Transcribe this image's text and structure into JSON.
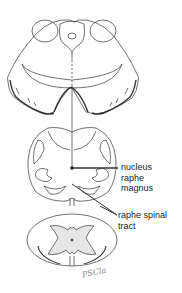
{
  "figure": {
    "sections": [
      {
        "name": "upper-brainstem-section"
      },
      {
        "name": "medulla-section"
      },
      {
        "name": "spinal-cord-section"
      }
    ],
    "labels": {
      "nucleus_line1": "nucleus",
      "nucleus_line2": "raphe",
      "nucleus_line3": "magnus",
      "tract_line1": "raphe spinal",
      "tract_line2": "tract"
    },
    "signature": "PSCla",
    "colors": {
      "stroke": "#333333",
      "gray_matter": "#e6e6e6",
      "background": "#ffffff"
    }
  }
}
